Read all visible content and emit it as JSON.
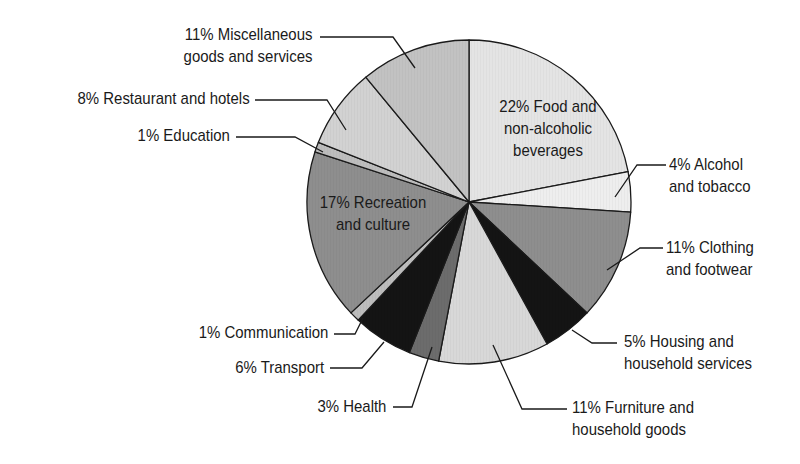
{
  "chart_data": {
    "type": "pie",
    "title": "",
    "start_angle": "12 o'clock",
    "direction": "clockwise",
    "center": [
      469,
      202
    ],
    "radius": 162,
    "slices": [
      {
        "label": "Food and non-alcoholic beverages",
        "value": 22,
        "text": [
          "22% Food and",
          "non-alcoholic",
          "beverages"
        ],
        "color": "#e4e4e4"
      },
      {
        "label": "Alcohol and tobacco",
        "value": 4,
        "text": [
          "4% Alcohol",
          "and tobacco"
        ],
        "color": "#eeeeee"
      },
      {
        "label": "Clothing and footwear",
        "value": 11,
        "text": [
          "11% Clothing",
          "and footwear"
        ],
        "color": "#8e8e8e"
      },
      {
        "label": "Housing and household services",
        "value": 5,
        "text": [
          "5% Housing and",
          "household services"
        ],
        "color": "#141414"
      },
      {
        "label": "Furniture and household goods",
        "value": 11,
        "text": [
          "11% Furniture and",
          "household goods"
        ],
        "color": "#d8d8d8"
      },
      {
        "label": "Health",
        "value": 3,
        "text": [
          "3% Health"
        ],
        "color": "#6c6c6c"
      },
      {
        "label": "Transport",
        "value": 6,
        "text": [
          "6% Transport"
        ],
        "color": "#141414"
      },
      {
        "label": "Communication",
        "value": 1,
        "text": [
          "1% Communication"
        ],
        "color": "#bdbdbd"
      },
      {
        "label": "Recreation and culture",
        "value": 17,
        "text": [
          "17% Recreation",
          "and culture"
        ],
        "color": "#8e8e8e"
      },
      {
        "label": "Education",
        "value": 1,
        "text": [
          "1% Education"
        ],
        "color": "#bdbdbd"
      },
      {
        "label": "Restaurant and hotels",
        "value": 8,
        "text": [
          "8% Restaurant and hotels"
        ],
        "color": "#d2d2d2"
      },
      {
        "label": "Miscellaneous goods and services",
        "value": 11,
        "text": [
          "11% Miscellaneous",
          "goods and services"
        ],
        "color": "#c2c2c2"
      }
    ],
    "legend": "none (callout labels)"
  },
  "labels": {
    "food": [
      "22% Food and",
      "non-alcoholic",
      "beverages"
    ],
    "alcohol": [
      "4% Alcohol",
      "and tobacco"
    ],
    "clothing": [
      "11% Clothing",
      "and footwear"
    ],
    "housing": [
      "5% Housing and",
      "household services"
    ],
    "furniture": [
      "11% Furniture and",
      "household goods"
    ],
    "health": "3% Health",
    "transport": "6% Transport",
    "communication": "1% Communication",
    "recreation": [
      "17% Recreation",
      "and culture"
    ],
    "education": "1% Education",
    "restaurant": "8% Restaurant and hotels",
    "misc": [
      "11% Miscellaneous",
      "goods and services"
    ]
  },
  "leaders": [
    {
      "name": "misc",
      "points": [
        [
          320,
          37
        ],
        [
          393,
          37
        ],
        [
          415,
          68
        ]
      ]
    },
    {
      "name": "restaurant",
      "points": [
        [
          255,
          100
        ],
        [
          327,
          100
        ],
        [
          346,
          130
        ]
      ]
    },
    {
      "name": "education",
      "points": [
        [
          236,
          137
        ],
        [
          295,
          137
        ],
        [
          323,
          152
        ]
      ]
    },
    {
      "name": "communication",
      "points": [
        [
          334,
          334
        ],
        [
          355,
          334
        ],
        [
          363,
          318
        ]
      ]
    },
    {
      "name": "transport",
      "points": [
        [
          330,
          368
        ],
        [
          362,
          368
        ],
        [
          384,
          342
        ]
      ]
    },
    {
      "name": "health",
      "points": [
        [
          393,
          407
        ],
        [
          412,
          407
        ],
        [
          432,
          347
        ]
      ]
    },
    {
      "name": "furniture",
      "points": [
        [
          567,
          409
        ],
        [
          522,
          409
        ],
        [
          493,
          345
        ]
      ]
    },
    {
      "name": "housing",
      "points": [
        [
          617,
          343
        ],
        [
          592,
          343
        ],
        [
          572,
          330
        ]
      ]
    },
    {
      "name": "clothing",
      "points": [
        [
          663,
          248
        ],
        [
          640,
          248
        ],
        [
          607,
          270
        ]
      ]
    },
    {
      "name": "alcohol",
      "points": [
        [
          666,
          165
        ],
        [
          637,
          165
        ],
        [
          615,
          197
        ]
      ]
    }
  ]
}
